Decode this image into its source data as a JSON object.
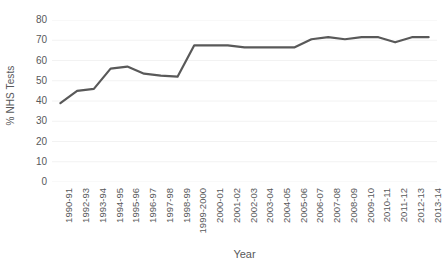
{
  "chart_data": {
    "type": "line",
    "title": "",
    "xlabel": "Year",
    "ylabel": "% NHS Tests",
    "ylim": [
      0,
      80
    ],
    "y_ticks": [
      80,
      70,
      60,
      50,
      40,
      30,
      20,
      10,
      0
    ],
    "grid": true,
    "grid_axis": "y",
    "legend": "none",
    "line_color": "#595959",
    "line_width": 2.2,
    "categories": [
      "1990-91",
      "1992-93",
      "1993-94",
      "1994-95",
      "1995-96",
      "1996-97",
      "1997-98",
      "1998-99",
      "1999-2000",
      "2000-01",
      "2001-02",
      "2002-03",
      "2003-04",
      "2004-05",
      "2005-06",
      "2006-07",
      "2007-08",
      "2008-09",
      "2009-10",
      "2010-11",
      "2011-12",
      "2012-13",
      "2013-14"
    ],
    "values": [
      39.0,
      45.0,
      46.0,
      56.0,
      57.0,
      53.5,
      52.5,
      52.0,
      67.5,
      67.5,
      67.5,
      66.5,
      66.5,
      66.5,
      66.5,
      70.5,
      71.5,
      70.5,
      71.5,
      71.5,
      69.0,
      71.5,
      71.5
    ]
  }
}
